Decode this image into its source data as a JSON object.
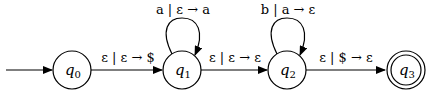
{
  "diagram": {
    "type": "pushdown-automaton",
    "states": [
      {
        "id": "q0",
        "name": "q",
        "sub": "0",
        "start": true,
        "accept": false
      },
      {
        "id": "q1",
        "name": "q",
        "sub": "1",
        "start": false,
        "accept": false
      },
      {
        "id": "q2",
        "name": "q",
        "sub": "2",
        "start": false,
        "accept": false
      },
      {
        "id": "q3",
        "name": "q",
        "sub": "3",
        "start": false,
        "accept": true
      }
    ],
    "transitions": [
      {
        "from": "q0",
        "to": "q1",
        "label": "ε | ε → $"
      },
      {
        "from": "q1",
        "to": "q1",
        "label": "a | ε → a"
      },
      {
        "from": "q1",
        "to": "q2",
        "label": "ε | ε → ε"
      },
      {
        "from": "q2",
        "to": "q2",
        "label": "b | a → ε"
      },
      {
        "from": "q2",
        "to": "q3",
        "label": "ε | $ → ε"
      }
    ]
  }
}
